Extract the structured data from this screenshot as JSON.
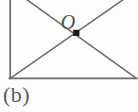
{
  "figure": {
    "caption": "(b)",
    "background_color": "#fdfdfd",
    "line_color": "#6a6a6a",
    "marker_color": "#1b1b1b",
    "label_color": "#4f4f4f",
    "stroke_width": 1.6,
    "labels": [
      {
        "name": "point-o",
        "text": "O",
        "x": 66,
        "y": 22
      }
    ],
    "markers": [
      {
        "name": "intersection-point",
        "shape": "square",
        "x": 76,
        "y": 33,
        "size": 6,
        "color": "#1b1b1b"
      }
    ],
    "shape": {
      "type": "rectangle-with-diagonals",
      "left": 10,
      "right": 136,
      "bottom": 78,
      "top_clipped": true,
      "vertices": {
        "bottom_left": [
          10,
          78
        ],
        "bottom_right": [
          136,
          78
        ],
        "top_left_offscreen": [
          10,
          -12
        ],
        "top_right_offscreen": [
          136,
          -12
        ]
      },
      "segments": [
        {
          "name": "left-edge",
          "x1": 10,
          "y1": 0,
          "x2": 10,
          "y2": 78
        },
        {
          "name": "bottom-edge",
          "x1": 10,
          "y1": 78,
          "x2": 136,
          "y2": 78
        },
        {
          "name": "diagonal-top-left-to-bottom-right",
          "x1": 25,
          "y1": 0,
          "x2": 136,
          "y2": 78
        },
        {
          "name": "diagonal-bottom-left-to-top-right",
          "x1": 10,
          "y1": 78,
          "x2": 125,
          "y2": 0
        }
      ]
    }
  }
}
